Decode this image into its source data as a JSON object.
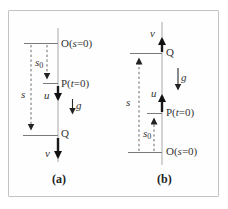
{
  "figure": {
    "panel_a": {
      "caption": "(a)",
      "origin_label": {
        "pre": "O(",
        "var": "s",
        "post": "=0)"
      },
      "start_label": {
        "pre": "P(",
        "var": "t",
        "post": "=0)"
      },
      "end_label": "Q",
      "initial_velocity": "u",
      "final_velocity": "v",
      "gravity": "g",
      "displacement": "s",
      "offset": {
        "base": "s",
        "sub": "0"
      }
    },
    "panel_b": {
      "caption": "(b)",
      "origin_label": {
        "pre": "O(",
        "var": "s",
        "post": "=0)"
      },
      "start_label": {
        "pre": "P(",
        "var": "t",
        "post": "=0)"
      },
      "end_label": "Q",
      "initial_velocity": "u",
      "final_velocity": "v",
      "gravity": "g",
      "displacement": "s",
      "offset": {
        "base": "s",
        "sub": "0"
      }
    },
    "colors": {
      "axis_line": "#a8a8a8",
      "tick_line": "#7a7a7a",
      "dashed_line": "#5a5a5a",
      "arrow": "#1a1a1a",
      "border": "#c4c4c4",
      "text": "#333333"
    }
  }
}
